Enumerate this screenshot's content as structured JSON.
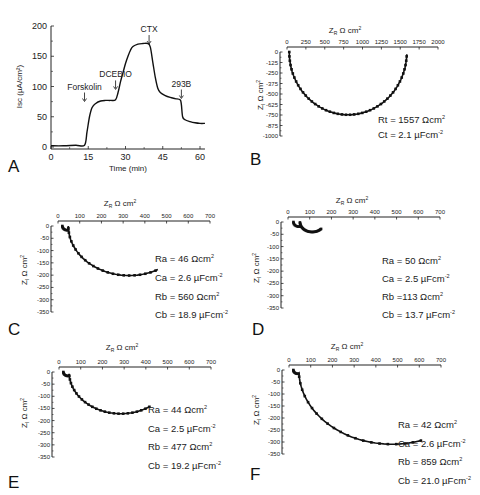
{
  "chart_data": [
    {
      "panel": "A",
      "type": "line",
      "title": "",
      "xlabel": "Time (min)",
      "ylabel": "Isc (µA/cm²)",
      "xlim": [
        0,
        62
      ],
      "ylim": [
        0,
        200
      ],
      "xticks": [
        0,
        15,
        30,
        45,
        60
      ],
      "yticks": [
        0,
        50,
        100,
        150,
        200
      ],
      "grid": false,
      "x": [
        0,
        5,
        10,
        13.5,
        14.5,
        15.5,
        16.5,
        18,
        20,
        22,
        24,
        26,
        27,
        28,
        29,
        30,
        31,
        32,
        33,
        35,
        37,
        39,
        40,
        41,
        42,
        43,
        44,
        46,
        48,
        50,
        52,
        52.5,
        53,
        54,
        56,
        58,
        60,
        62
      ],
      "y": [
        2,
        2,
        3,
        3,
        25,
        50,
        65,
        72,
        76,
        77,
        77,
        78,
        90,
        108,
        123,
        138,
        150,
        160,
        166,
        170,
        171,
        171,
        165,
        140,
        115,
        97,
        90,
        85,
        82,
        80,
        78,
        70,
        50,
        45,
        42,
        40,
        39,
        39
      ],
      "annotations": [
        {
          "label": "Forskolin",
          "x": 13.5,
          "y": 95
        },
        {
          "label": "DCEBIO",
          "x": 26,
          "y": 115
        },
        {
          "label": "CTX",
          "x": 39.5,
          "y": 190
        },
        {
          "label": "293B",
          "x": 52.5,
          "y": 100
        }
      ]
    },
    {
      "panel": "B",
      "type": "scatter",
      "xlabel": "ZR Ω cm²",
      "ylabel": "ZI Ω cm²",
      "xlim": [
        0,
        2000
      ],
      "ylim": [
        -1000,
        0
      ],
      "xticks": [
        0,
        250,
        500,
        750,
        1000,
        1250,
        1500,
        1750,
        2000
      ],
      "yticks": [
        0,
        -125,
        -250,
        -375,
        -500,
        -625,
        -750,
        -875,
        -1000
      ],
      "model": {
        "type": "single_rc",
        "offset": 30,
        "Rt": 1557,
        "Ct": 2.1
      },
      "parameters": [
        "Rt = 1557 Ωcm²",
        "Ct = 2.1 µFcm⁻²"
      ]
    },
    {
      "panel": "C",
      "type": "scatter",
      "xlabel": "ZR Ω cm²",
      "ylabel": "ZI Ω cm²",
      "xlim": [
        0,
        700
      ],
      "ylim": [
        -350,
        0
      ],
      "xticks": [
        0,
        100,
        200,
        300,
        400,
        500,
        600,
        700
      ],
      "yticks": [
        0,
        -50,
        -100,
        -150,
        -200,
        -250,
        -300,
        -350
      ],
      "model": {
        "type": "two_rc",
        "offset": 20,
        "Ra": 46,
        "Rb": 560,
        "x_end": 470
      },
      "parameters": [
        "Ra = 46 Ωcm²",
        "Ca = 2.6 µFcm⁻²",
        "Rb = 560 Ωcm²",
        "Cb = 18.9 µFcm⁻²"
      ]
    },
    {
      "panel": "D",
      "type": "scatter",
      "xlabel": "ZR Ω cm²",
      "ylabel": "ZI Ω cm²",
      "xlim": [
        0,
        700
      ],
      "ylim": [
        -350,
        0
      ],
      "xticks": [
        0,
        100,
        200,
        300,
        400,
        500,
        600,
        700
      ],
      "yticks": [
        0,
        -50,
        -100,
        -150,
        -200,
        -250,
        -300,
        -350
      ],
      "model": {
        "type": "two_rc",
        "offset": 25,
        "Ra": 50,
        "Rb": 113,
        "x_end": 155
      },
      "parameters": [
        "Ra = 50 Ωcm²",
        "Ca = 2.5 µFcm⁻²",
        "Rb =113 Ωcm²",
        "Cb = 13.7 µFcm⁻²"
      ]
    },
    {
      "panel": "E",
      "type": "scatter",
      "xlabel": "ZR Ω cm²",
      "ylabel": "ZI Ω cm²",
      "xlim": [
        0,
        700
      ],
      "ylim": [
        -350,
        0
      ],
      "xticks": [
        0,
        100,
        200,
        300,
        400,
        500,
        600,
        700
      ],
      "yticks": [
        0,
        -50,
        -100,
        -150,
        -200,
        -250,
        -300,
        -350
      ],
      "model": {
        "type": "two_rc",
        "offset": 20,
        "Ra": 44,
        "Rb": 477,
        "x_end": 425
      },
      "parameters": [
        "Ra = 44 Ωcm²",
        "Ca = 2.5 µFcm⁻²",
        "Rb = 477 Ωcm²",
        "Cb = 19.2 µFcm⁻²"
      ]
    },
    {
      "panel": "F",
      "type": "scatter",
      "xlabel": "ZR Ω cm²",
      "ylabel": "ZI Ω cm²",
      "xlim": [
        0,
        700
      ],
      "ylim": [
        -350,
        0
      ],
      "xticks": [
        0,
        100,
        200,
        300,
        400,
        500,
        600,
        700
      ],
      "yticks": [
        0,
        -50,
        -100,
        -150,
        -200,
        -250,
        -300,
        -350
      ],
      "model": {
        "type": "two_rc",
        "offset": 20,
        "Ra": 42,
        "Rb": 859,
        "x_end": 610
      },
      "parameters": [
        "Ra = 42 Ωcm²",
        "Ca = 2.6 µFcm⁻²",
        "Rb = 859 Ωcm²",
        "Cb = 21.0 µFcm⁻²"
      ]
    }
  ],
  "layout": {
    "A": {
      "x0": 51,
      "x1": 205,
      "y0": 147,
      "y1": 26,
      "letter_x": 8,
      "letter_y": 172
    },
    "B": {
      "x0": 287,
      "x1": 438,
      "y0": 52,
      "y1": 136,
      "letter_x": 250,
      "letter_y": 165,
      "title_x": 345,
      "title_y": 33,
      "params_x": 378,
      "params_y": [
        123,
        138
      ],
      "ylabel_x": 263,
      "ylabel_y": 95
    },
    "C": {
      "x0": 58,
      "x1": 210,
      "y0": 226,
      "y1": 312,
      "letter_x": 8,
      "letter_y": 335,
      "title_x": 120,
      "title_y": 206,
      "params_x": 155,
      "params_y": [
        262,
        281,
        300,
        318
      ],
      "ylabel_x": 27,
      "ylabel_y": 270
    },
    "D": {
      "x0": 288,
      "x1": 440,
      "y0": 222,
      "y1": 308,
      "letter_x": 252,
      "letter_y": 335,
      "title_x": 352,
      "title_y": 203,
      "params_x": 382,
      "params_y": [
        264,
        282,
        300,
        318
      ],
      "ylabel_x": 259,
      "ylabel_y": 268
    },
    "E": {
      "x0": 59,
      "x1": 211,
      "y0": 372,
      "y1": 457,
      "letter_x": 8,
      "letter_y": 488,
      "title_x": 122,
      "title_y": 350,
      "params_x": 148,
      "params_y": [
        413,
        432,
        450,
        469
      ],
      "ylabel_x": 27,
      "ylabel_y": 413
    },
    "F": {
      "x0": 289,
      "x1": 441,
      "y0": 370,
      "y1": 454,
      "letter_x": 250,
      "letter_y": 480,
      "title_x": 347,
      "title_y": 349,
      "params_x": 398,
      "params_y": [
        428,
        447,
        465,
        484
      ],
      "ylabel_x": 259,
      "ylabel_y": 410
    }
  }
}
